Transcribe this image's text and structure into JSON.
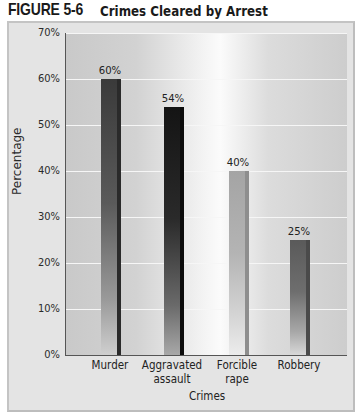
{
  "figure": {
    "number": "FIGURE 5-6",
    "title": "Crimes Cleared by Arrest"
  },
  "chart_data": {
    "type": "bar",
    "title": "Crimes Cleared by Arrest",
    "xlabel": "Crimes",
    "ylabel": "Percentage",
    "ylim": [
      0,
      70
    ],
    "yticks": [
      "0%",
      "10%",
      "20%",
      "30%",
      "40%",
      "50%",
      "60%",
      "70%"
    ],
    "grid": true,
    "categories": [
      "Murder",
      "Aggravated assault",
      "Forcible rape",
      "Robbery"
    ],
    "category_lines": [
      [
        "Murder"
      ],
      [
        "Aggravated",
        "assault"
      ],
      [
        "Forcible",
        "rape"
      ],
      [
        "Robbery"
      ]
    ],
    "values": [
      60,
      54,
      40,
      25
    ],
    "value_labels": [
      "60%",
      "54%",
      "40%",
      "25%"
    ],
    "bar_colors": [
      "#3a3a3a",
      "#1c1c1c",
      "#a6a6a6",
      "#5e5e5e"
    ]
  }
}
